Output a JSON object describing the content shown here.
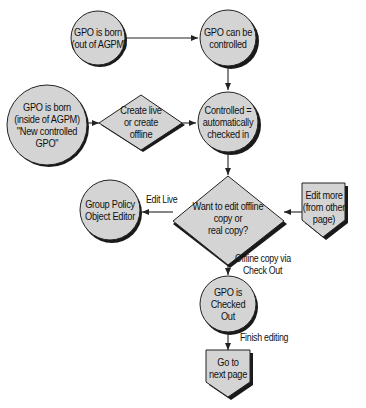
{
  "diagram": {
    "type": "flowchart",
    "colors": {
      "node_fill": "#d4d4d4",
      "node_stroke": "#222222",
      "shadow": "#1a1a1a",
      "edge": "#222222",
      "background": "#ffffff"
    },
    "nodes": {
      "born_out": {
        "shape": "circle",
        "lines": [
          "GPO is born",
          "(out of AGPM)"
        ]
      },
      "can_be_controlled": {
        "shape": "circle",
        "lines": [
          "GPO can be",
          "controlled"
        ]
      },
      "born_inside": {
        "shape": "circle",
        "lines": [
          "GPO is born",
          "(inside of AGPM)",
          "\"New controlled",
          "GPO\""
        ]
      },
      "create_choice": {
        "shape": "diamond",
        "lines": [
          "Create live",
          "or create",
          "offline"
        ]
      },
      "checked_in": {
        "shape": "circle",
        "lines": [
          "Controlled =",
          "automatically",
          "checked in"
        ]
      },
      "edit_choice": {
        "shape": "diamond",
        "lines": [
          "Want to edit offline",
          "copy or",
          "real copy?"
        ]
      },
      "gpo_editor": {
        "shape": "circle",
        "lines": [
          "Group Policy",
          "Object Editor"
        ]
      },
      "edit_more": {
        "shape": "off-page-connector",
        "lines": [
          "Edit more",
          "(from other",
          "page)"
        ]
      },
      "checked_out": {
        "shape": "circle",
        "lines": [
          "GPO is",
          "Checked",
          "Out"
        ]
      },
      "next_page": {
        "shape": "off-page-connector",
        "lines": [
          "Go to",
          "next page"
        ]
      }
    },
    "edges": [
      {
        "from": "born_out",
        "to": "can_be_controlled",
        "label": ""
      },
      {
        "from": "can_be_controlled",
        "to": "checked_in",
        "label": ""
      },
      {
        "from": "born_inside",
        "to": "create_choice",
        "label": ""
      },
      {
        "from": "create_choice",
        "to": "checked_in",
        "label": ""
      },
      {
        "from": "checked_in",
        "to": "edit_choice",
        "label": ""
      },
      {
        "from": "edit_choice",
        "to": "gpo_editor",
        "label": "Edit Live"
      },
      {
        "from": "edit_more",
        "to": "edit_choice",
        "label": ""
      },
      {
        "from": "edit_choice",
        "to": "checked_out",
        "label": [
          "Offline copy via",
          "Check Out"
        ]
      },
      {
        "from": "checked_out",
        "to": "next_page",
        "label": "Finish editing"
      }
    ]
  }
}
